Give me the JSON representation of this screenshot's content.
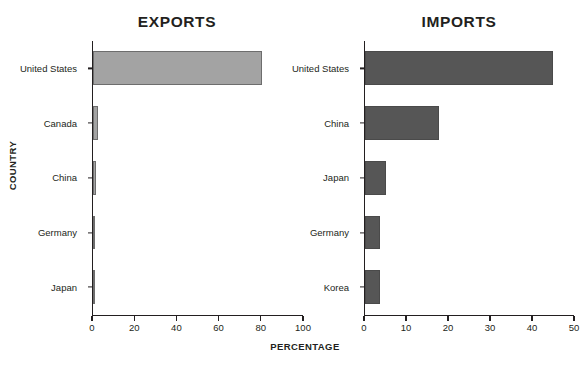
{
  "figure": {
    "xaxis_title": "PERCENTAGE",
    "yaxis_title": "COUNTRY",
    "export_bar_color": "#a3a3a3",
    "import_bar_color": "#565656",
    "axis_color": "#231f20",
    "background": "#ffffff"
  },
  "chart_data": [
    {
      "type": "bar",
      "orientation": "horizontal",
      "title": "EXPORTS",
      "categories": [
        "United States",
        "Canada",
        "China",
        "Germany",
        "Japan"
      ],
      "values": [
        80.5,
        2.4,
        1.5,
        1.0,
        1.0
      ],
      "xlabel": "PERCENTAGE",
      "ylabel": "COUNTRY",
      "xlim": [
        0,
        100
      ],
      "xticks": [
        0,
        20,
        40,
        60,
        80,
        100
      ],
      "xticklabels": [
        "0",
        "20",
        "40",
        "60",
        "80",
        "100"
      ],
      "grid": false,
      "legend": false,
      "bar_color": "#a3a3a3"
    },
    {
      "type": "bar",
      "orientation": "horizontal",
      "title": "IMPORTS",
      "categories": [
        "United States",
        "China",
        "Japan",
        "Germany",
        "Korea"
      ],
      "values": [
        45.0,
        17.6,
        5.0,
        3.5,
        3.5
      ],
      "xlabel": "PERCENTAGE",
      "ylabel": "COUNTRY",
      "xlim": [
        0,
        50
      ],
      "xticks": [
        0,
        10,
        20,
        30,
        40,
        50
      ],
      "xticklabels": [
        "0",
        "10",
        "20",
        "30",
        "40",
        "50"
      ],
      "grid": false,
      "legend": false,
      "bar_color": "#565656"
    }
  ]
}
